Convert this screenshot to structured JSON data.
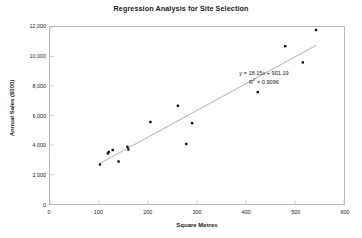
{
  "chart_data": {
    "type": "scatter",
    "title": "Regression Analysis for Site Selection",
    "xlabel": "Square Metres",
    "ylabel": "Annual Sales ($000)",
    "xlim": [
      0,
      600
    ],
    "ylim": [
      0,
      12000
    ],
    "grid": false,
    "legend": null,
    "x_ticks": [
      "0",
      "100",
      "200",
      "300",
      "400",
      "500",
      "600"
    ],
    "x_tick_values": [
      0,
      100,
      200,
      300,
      400,
      500,
      600
    ],
    "y_ticks": [
      "0",
      "2,000",
      "4,000",
      "6,000",
      "8,000",
      "10,000",
      "12,000"
    ],
    "y_tick_values": [
      0,
      2000,
      4000,
      6000,
      8000,
      10000,
      12000
    ],
    "marker": "square",
    "marker_color": "#111111",
    "points": [
      {
        "x": 102,
        "y": 2680
      },
      {
        "x": 118,
        "y": 3430
      },
      {
        "x": 120,
        "y": 3530
      },
      {
        "x": 128,
        "y": 3660
      },
      {
        "x": 140,
        "y": 2880
      },
      {
        "x": 158,
        "y": 3880
      },
      {
        "x": 160,
        "y": 3700
      },
      {
        "x": 205,
        "y": 5560
      },
      {
        "x": 261,
        "y": 6660
      },
      {
        "x": 278,
        "y": 4070
      },
      {
        "x": 290,
        "y": 5480
      },
      {
        "x": 424,
        "y": 7580
      },
      {
        "x": 480,
        "y": 10700
      },
      {
        "x": 516,
        "y": 9600
      },
      {
        "x": 543,
        "y": 11800
      }
    ],
    "trendline": {
      "slope": 18.15,
      "intercept": 901.19,
      "color": "#9a9a9a",
      "x_start": 102,
      "x_end": 543
    },
    "annotations": {
      "equation": "y = 18.15x + 901.19",
      "r_squared_prefix": "R",
      "r_squared_exponent": "2",
      "r_squared_value": " = 0.9096"
    }
  },
  "colors": {
    "frame": "#b9b9b9",
    "text": "#1a1a1a",
    "background": "#ffffff"
  }
}
